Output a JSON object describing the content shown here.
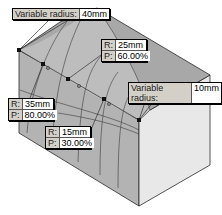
{
  "diagram": {
    "colors": {
      "top_face": "#a9a9a9",
      "left_face": "#b5b5b5",
      "right_face": "#e6e6e6",
      "fillet_face": "#c4c4c4",
      "edge": "#2a2a2a",
      "callout_bg": "#d4d0c8",
      "value_bg": "#ffffff"
    },
    "end_callouts": [
      {
        "label": "Variable radius:",
        "value": "40mm"
      },
      {
        "label": "Variable radius:",
        "value": "10mm"
      }
    ],
    "point_callouts": [
      {
        "r_label": "R:",
        "r_value": "25mm",
        "p_label": "P:",
        "p_value": "60.00%"
      },
      {
        "r_label": "R:",
        "r_value": "35mm",
        "p_label": "P:",
        "p_value": "80.00%"
      },
      {
        "r_label": "R:",
        "r_value": "15mm",
        "p_label": "P:",
        "p_value": "30.00%"
      }
    ]
  }
}
